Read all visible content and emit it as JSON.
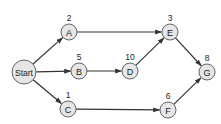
{
  "diagram": {
    "type": "network-activity-graph",
    "colors": {
      "node_fill": "#e6e6e6",
      "node_stroke": "#555555",
      "edge": "#333333",
      "text": "#222222",
      "background": "#ffffff"
    },
    "nodes": [
      {
        "id": "start",
        "label": "Start",
        "weight": null,
        "cx": 24,
        "cy": 72,
        "r": 12
      },
      {
        "id": "A",
        "label": "A",
        "weight": "2",
        "cx": 69,
        "cy": 32,
        "r": 8
      },
      {
        "id": "B",
        "label": "B",
        "weight": "5",
        "cx": 79,
        "cy": 71,
        "r": 8
      },
      {
        "id": "C",
        "label": "C",
        "weight": "1",
        "cx": 68,
        "cy": 109,
        "r": 8
      },
      {
        "id": "D",
        "label": "D",
        "weight": "10",
        "cx": 130,
        "cy": 71,
        "r": 8
      },
      {
        "id": "E",
        "label": "E",
        "weight": "3",
        "cx": 170,
        "cy": 32,
        "r": 8
      },
      {
        "id": "F",
        "label": "F",
        "weight": "6",
        "cx": 168,
        "cy": 110,
        "r": 8
      },
      {
        "id": "G",
        "label": "G",
        "weight": "8",
        "cx": 207,
        "cy": 72,
        "r": 8
      }
    ],
    "edges": [
      {
        "from": "start",
        "to": "A"
      },
      {
        "from": "start",
        "to": "B"
      },
      {
        "from": "start",
        "to": "C"
      },
      {
        "from": "A",
        "to": "E"
      },
      {
        "from": "B",
        "to": "D"
      },
      {
        "from": "D",
        "to": "E"
      },
      {
        "from": "C",
        "to": "F"
      },
      {
        "from": "E",
        "to": "G"
      },
      {
        "from": "F",
        "to": "G"
      }
    ]
  }
}
